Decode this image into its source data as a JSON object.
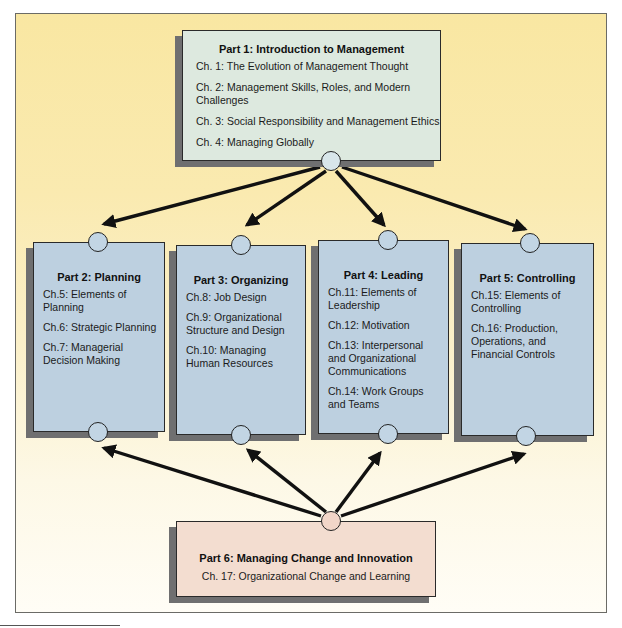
{
  "diagram": {
    "type": "book-structure-flow",
    "colors": {
      "background_top": "#f9e7a2",
      "background_bottom": "#fffdf6",
      "part1_fill": "#dde9df",
      "parts_2_5_fill": "#bdd0e0",
      "part6_fill": "#f3ddd0",
      "shadow": "#6f6f70",
      "arrows": "#111111"
    },
    "part1": {
      "title": "Part 1: Introduction to Management",
      "chapters": [
        "Ch. 1: The Evolution of Management Thought",
        "Ch. 2: Management Skills, Roles, and Modern Challenges",
        "Ch. 3: Social Responsibility and Management Ethics",
        "Ch. 4: Managing Globally"
      ]
    },
    "columns": [
      {
        "title": "Part 2: Planning",
        "chapters": [
          "Ch.5: Elements of Planning",
          "Ch.6: Strategic Planning",
          "Ch.7: Managerial Decision Making"
        ]
      },
      {
        "title": "Part 3: Organizing",
        "chapters": [
          "Ch.8: Job Design",
          "Ch.9: Organizational Structure and Design",
          "Ch.10: Managing Human Resources"
        ]
      },
      {
        "title": "Part 4: Leading",
        "chapters": [
          "Ch.11: Elements of Leadership",
          "Ch.12: Motivation",
          "Ch.13: Interpersonal and Organizational Communications",
          "Ch.14: Work Groups and Teams"
        ]
      },
      {
        "title": "Part 5: Controlling",
        "chapters": [
          "Ch.15: Elements of Controlling",
          "Ch.16: Production, Operations, and Financial Controls"
        ]
      }
    ],
    "part6": {
      "title": "Part 6: Managing Change and Innovation",
      "chapters": [
        "Ch. 17: Organizational Change and Learning"
      ]
    },
    "edges": [
      {
        "from": "part1",
        "to": "part2"
      },
      {
        "from": "part1",
        "to": "part3"
      },
      {
        "from": "part1",
        "to": "part4"
      },
      {
        "from": "part1",
        "to": "part5"
      },
      {
        "from": "part6",
        "to": "part2"
      },
      {
        "from": "part6",
        "to": "part3"
      },
      {
        "from": "part6",
        "to": "part4"
      },
      {
        "from": "part6",
        "to": "part5"
      }
    ]
  }
}
